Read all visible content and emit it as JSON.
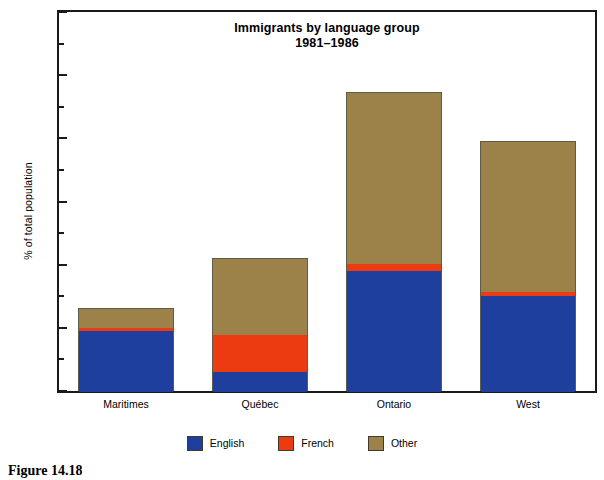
{
  "chart_data": {
    "type": "bar",
    "subtype": "stacked-bar",
    "title": "Immigrants by language group",
    "subtitle": "1981–1986",
    "xlabel": "",
    "ylabel": "% of total population",
    "ylim": [
      0,
      3
    ],
    "ytick_labels": [
      "0",
      "0.5",
      "1",
      "1.5",
      "2",
      "2.5",
      "3"
    ],
    "ytick_values": [
      0,
      0.5,
      1,
      1.5,
      2,
      2.5,
      3
    ],
    "yminor_tick_values": [
      0.25,
      0.75,
      1.25,
      1.75,
      2.25,
      2.75
    ],
    "grid": false,
    "legend_position": "bottom-center",
    "categories": [
      "Maritimes",
      "Québec",
      "Ontario",
      "West"
    ],
    "series": [
      {
        "name": "English",
        "color": "#1f3f9e",
        "values": [
          0.48,
          0.16,
          0.96,
          0.76
        ]
      },
      {
        "name": "French",
        "color": "#ec3a11",
        "values": [
          0.03,
          0.29,
          0.05,
          0.03
        ]
      },
      {
        "name": "Other",
        "color": "#9c8248",
        "values": [
          0.15,
          0.6,
          1.36,
          1.19
        ]
      }
    ],
    "totals": [
      0.66,
      1.05,
      2.37,
      1.98
    ]
  },
  "legend": {
    "items": [
      {
        "label": "English",
        "swatch": "english"
      },
      {
        "label": "French",
        "swatch": "french"
      },
      {
        "label": "Other",
        "swatch": "other"
      }
    ]
  },
  "caption": {
    "text": "Figure 14.18"
  }
}
